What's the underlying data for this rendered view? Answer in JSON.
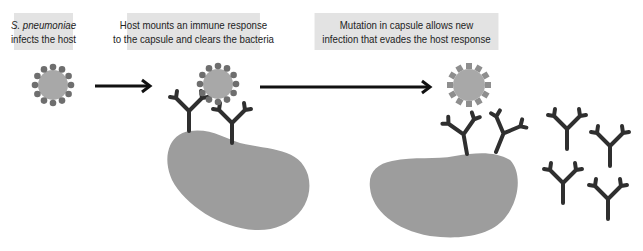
{
  "diagram": {
    "colors": {
      "label_bg": "#e3e3e3",
      "bacterium_core": "#a8a8a8",
      "capsule_dots": "#6e6e6e",
      "mutant_teeth": "#8e8e8e",
      "host_cell": "#9d9d9d",
      "antibody": "#2f2f2f",
      "arrow": "#111111"
    },
    "steps": [
      {
        "id": "step-1",
        "label_line1": "S. pneumoniae",
        "label_line2": "infects the host",
        "line1_italic": true
      },
      {
        "id": "step-2",
        "label_line1": "Host mounts an immune response",
        "label_line2": "to the capsule and clears the bacteria"
      },
      {
        "id": "step-3",
        "label_line1": "Mutation in capsule allows new",
        "label_line2": "infection that evades the host response"
      }
    ],
    "elements": {
      "bacteria": [
        {
          "name": "original-bacterium",
          "capsule": "dotted"
        },
        {
          "name": "bound-bacterium",
          "capsule": "dotted"
        },
        {
          "name": "mutant-bacterium",
          "capsule": "toothed"
        }
      ],
      "host_cells": 2,
      "bound_antibodies": 4,
      "free_antibodies": 4,
      "arrows": 2
    }
  }
}
